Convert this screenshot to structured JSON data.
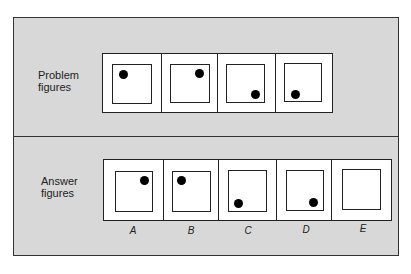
{
  "colors": {
    "panel_bg": "#d8d8d8",
    "frame": "#222222",
    "figure_bg": "#ffffff",
    "dot": "#000000"
  },
  "problem": {
    "label": "Problem\nfigures",
    "figures": [
      {
        "dot": "top-left"
      },
      {
        "dot": "top-right"
      },
      {
        "dot": "bottom-right"
      },
      {
        "dot": "bottom-left"
      }
    ]
  },
  "answer": {
    "label": "Answer\nfigures",
    "options": [
      {
        "letter": "A",
        "dot": "top-right"
      },
      {
        "letter": "B",
        "dot": "top-left"
      },
      {
        "letter": "C",
        "dot": "bottom-left"
      },
      {
        "letter": "D",
        "dot": "bottom-right"
      },
      {
        "letter": "E",
        "dot": "none"
      }
    ]
  }
}
